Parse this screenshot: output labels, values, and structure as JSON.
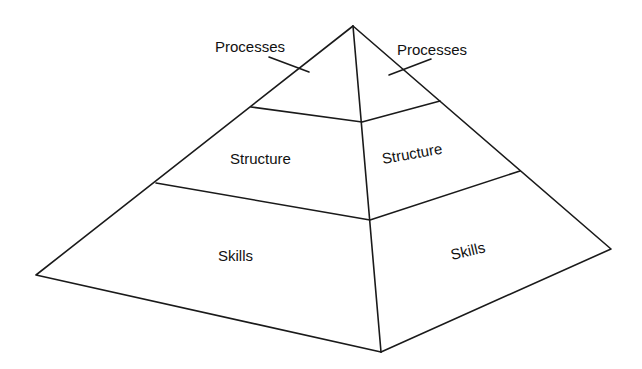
{
  "diagram": {
    "type": "pyramid",
    "tiers": [
      {
        "id": "top",
        "left_label": "Processes",
        "right_label": "Processes"
      },
      {
        "id": "middle",
        "left_label": "Structure",
        "right_label": "Structure"
      },
      {
        "id": "bottom",
        "left_label": "Skills",
        "right_label": "Skills"
      }
    ],
    "colors": {
      "stroke": "#1a1a1a",
      "background": "#ffffff",
      "text": "#111111"
    }
  }
}
